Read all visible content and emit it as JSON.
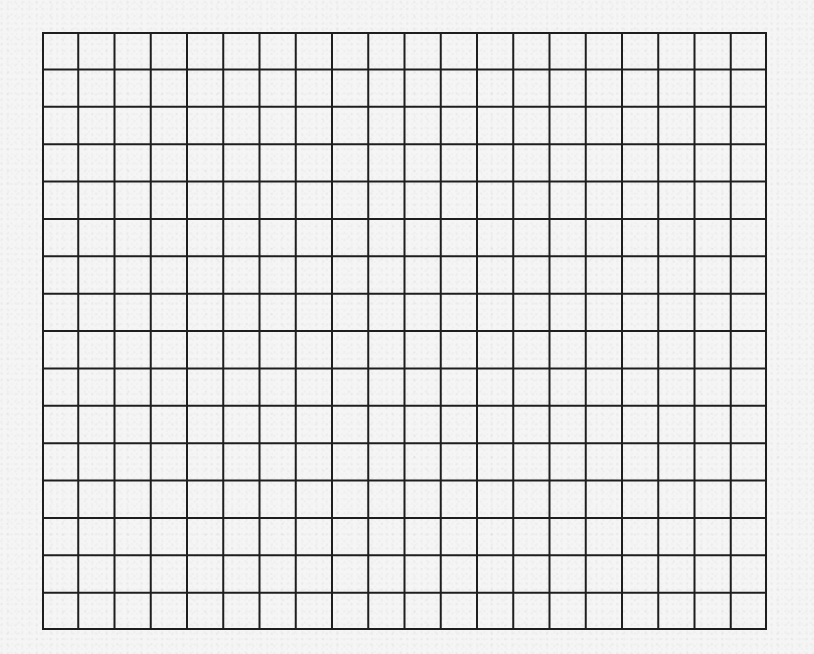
{
  "paper": {
    "background_color": "#f5f5f5",
    "texture": "speckled-paper"
  },
  "grid": {
    "columns": 20,
    "rows": 16,
    "left": 42,
    "top": 32,
    "width": 725,
    "height": 598,
    "cell_width": 36.25,
    "cell_height": 37.375,
    "line_color": "#1e1e1e",
    "line_width": 2,
    "cells_filled": []
  }
}
